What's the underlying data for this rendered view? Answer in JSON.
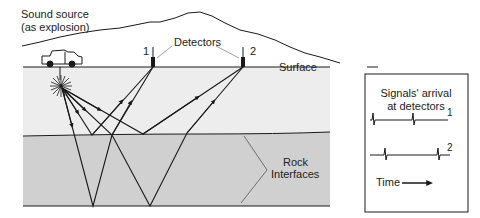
{
  "labels": {
    "source_line1": "Sound source",
    "source_line2": "(as explosion)",
    "detectors": "Detectors",
    "detector1": "1",
    "detector2": "2",
    "surface": "Surface",
    "rock_line1": "Rock",
    "rock_line2": "Interfaces"
  },
  "signal_box": {
    "title_line1": "Signals' arrival",
    "title_line2": "at detectors",
    "trace1_label": "1",
    "trace2_label": "2",
    "time_label": "Time"
  },
  "colors": {
    "upper_layer": "#ededed",
    "lower_layer": "#d0d0d0",
    "line": "#1a1a1a"
  }
}
